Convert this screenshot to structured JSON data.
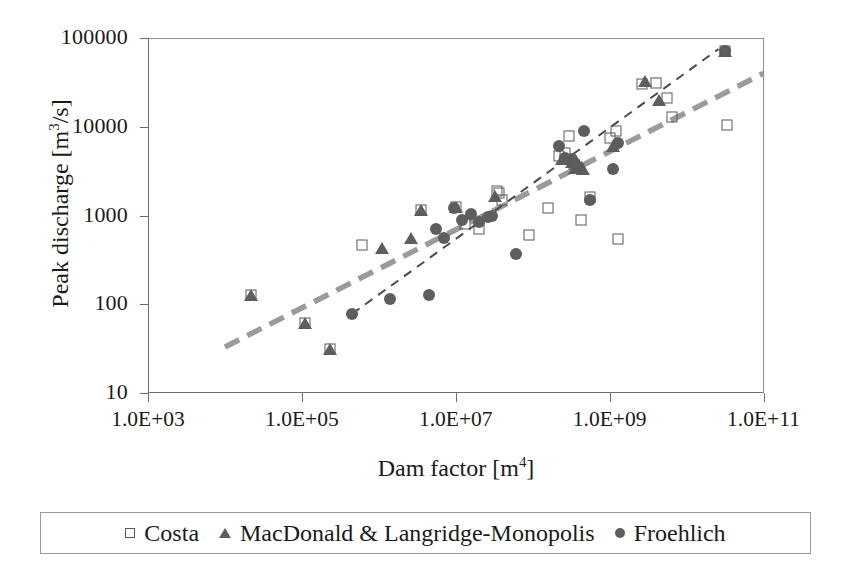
{
  "chart": {
    "type": "scatter",
    "title": "",
    "xlabel_html": "Dam factor [m<sup>4</sup>]",
    "ylabel_html": "Peak discharge [m<sup>3</sup>/s]",
    "xlabel_text": "Dam factor [m4]",
    "ylabel_text": "Peak discharge [m3/s]",
    "x_scale": "log",
    "y_scale": "log",
    "xlim": [
      1000,
      100000000000
    ],
    "ylim": [
      10,
      100000
    ],
    "xticks": [
      1000,
      100000,
      10000000,
      1000000000,
      100000000000
    ],
    "xtick_labels": [
      "1.0E+03",
      "1.0E+05",
      "1.0E+07",
      "1.0E+09",
      "1.0E+11"
    ],
    "yticks": [
      10,
      100,
      1000,
      10000,
      100000
    ],
    "ytick_labels": [
      "10",
      "100",
      "1000",
      "10000",
      "100000"
    ],
    "grid": false,
    "legend_position": "bottom-outside",
    "marker_color": "#5e5e5e",
    "open_marker_edge": "#585858",
    "axis_color": "#6e6e6e"
  },
  "legend": {
    "items": [
      {
        "label": "Costa",
        "marker": "open-square",
        "icon": "square-outline-icon"
      },
      {
        "label": "MacDonald & Langridge-Monopolis",
        "marker": "filled-triangle",
        "icon": "triangle-filled-icon"
      },
      {
        "label": "Froehlich",
        "marker": "filled-circle",
        "icon": "circle-filled-icon"
      }
    ]
  },
  "chart_data": {
    "type": "scatter",
    "title": "",
    "xlabel": "Dam factor [m^4]",
    "ylabel": "Peak discharge [m^3/s]",
    "x_scale": "log",
    "y_scale": "log",
    "xlim": [
      1000,
      100000000000
    ],
    "ylim": [
      10,
      100000
    ],
    "xticks": [
      1000,
      100000,
      10000000,
      1000000000,
      100000000000
    ],
    "xtick_labels": [
      "1.0E+03",
      "1.0E+05",
      "1.0E+07",
      "1.0E+09",
      "1.0E+11"
    ],
    "yticks": [
      10,
      100,
      1000,
      10000,
      100000
    ],
    "ytick_labels": [
      "10",
      "100",
      "1000",
      "10000",
      "100000"
    ],
    "grid": false,
    "legend_position": "bottom-outside",
    "series": [
      {
        "name": "Costa",
        "marker": "open-square",
        "points": [
          [
            22000.0,
            128
          ],
          [
            110000.0,
            62
          ],
          [
            230000.0,
            31
          ],
          [
            600000.0,
            470
          ],
          [
            3500000.0,
            1150
          ],
          [
            10000000.0,
            1250
          ],
          [
            13000000.0,
            800
          ],
          [
            20000000.0,
            700
          ],
          [
            34000000.0,
            1900
          ],
          [
            36000000.0,
            1800
          ],
          [
            40000000.0,
            1500
          ],
          [
            90000000.0,
            600
          ],
          [
            160000000.0,
            1200
          ],
          [
            220000000.0,
            4700
          ],
          [
            260000000.0,
            5000
          ],
          [
            300000000.0,
            7800
          ],
          [
            340000000.0,
            3800
          ],
          [
            380000000.0,
            3500
          ],
          [
            420000000.0,
            900
          ],
          [
            550000000.0,
            1600
          ],
          [
            1000000000.0,
            7500
          ],
          [
            1200000000.0,
            9000
          ],
          [
            1300000000.0,
            550
          ],
          [
            2600000000.0,
            30000
          ],
          [
            4000000000.0,
            31000
          ],
          [
            5500000000.0,
            21000
          ],
          [
            6500000000.0,
            13000
          ],
          [
            32000000000.0,
            72000
          ],
          [
            34000000000.0,
            10500
          ]
        ]
      },
      {
        "name": "MacDonald & Langridge-Monopolis",
        "marker": "filled-triangle",
        "points": [
          [
            22000.0,
            128
          ],
          [
            110000.0,
            62
          ],
          [
            230000.0,
            31
          ],
          [
            1100000.0,
            430
          ],
          [
            2600000.0,
            560
          ],
          [
            3500000.0,
            1150
          ],
          [
            10000000.0,
            1250
          ],
          [
            32000000.0,
            1650
          ],
          [
            240000000.0,
            4300
          ],
          [
            320000000.0,
            4000
          ],
          [
            360000000.0,
            3400
          ],
          [
            450000000.0,
            3300
          ],
          [
            1100000000.0,
            6000
          ],
          [
            2900000000.0,
            33000
          ],
          [
            4400000000.0,
            20000
          ],
          [
            32000000000.0,
            72000
          ]
        ]
      },
      {
        "name": "Froehlich",
        "marker": "filled-circle",
        "points": [
          [
            450000.0,
            78
          ],
          [
            1400000.0,
            115
          ],
          [
            4500000.0,
            127
          ],
          [
            5500000.0,
            700
          ],
          [
            7000000.0,
            560
          ],
          [
            9500000.0,
            1200
          ],
          [
            12000000.0,
            900
          ],
          [
            16000000.0,
            1050
          ],
          [
            20000000.0,
            850
          ],
          [
            26000000.0,
            950
          ],
          [
            30000000.0,
            1000
          ],
          [
            60000000.0,
            370
          ],
          [
            220000000.0,
            6000
          ],
          [
            260000000.0,
            4500
          ],
          [
            320000000.0,
            4300
          ],
          [
            360000000.0,
            3800
          ],
          [
            400000000.0,
            3400
          ],
          [
            460000000.0,
            9000
          ],
          [
            550000000.0,
            1500
          ],
          [
            1100000000.0,
            3300
          ],
          [
            1300000000.0,
            6500
          ],
          [
            32000000000.0,
            72000
          ]
        ]
      }
    ],
    "trendlines": [
      {
        "name": "thick-gray-dashed-regression",
        "style": "dashed",
        "width": "thick",
        "color": "#9b9b9b",
        "x_start": 10000.0,
        "y_start": 33,
        "x_end": 100000000000.0,
        "y_end": 40000
      },
      {
        "name": "thin-dark-dashed-regression",
        "style": "dashed",
        "width": "thin",
        "color": "#4a4a4a",
        "x_start": 450000.0,
        "y_start": 78,
        "x_end": 26000000000.0,
        "y_end": 75000
      }
    ]
  }
}
